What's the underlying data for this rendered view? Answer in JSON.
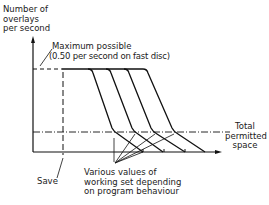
{
  "diagram": {
    "y_axis_label": "Number of\noverlays\nper second",
    "max_label_line1": "Maximum possible",
    "max_label_line2": "(0.50 per second on fast disc)",
    "right_label": "Total\npermitted\nspace",
    "save_label": "Save",
    "curves_label": "Various values of\nworking set depending\non program behaviour",
    "curve_count": 4
  }
}
